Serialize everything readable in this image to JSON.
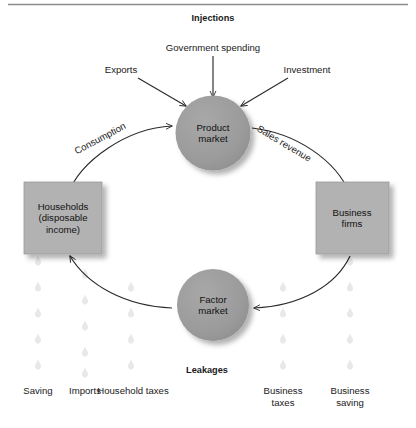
{
  "diagram": {
    "title_top": "Injections",
    "title_bottom": "Leakages",
    "nodes": {
      "product_market": "Product\nmarket",
      "factor_market": "Factor\nmarket",
      "households": "Households\n(disposable\nincome)",
      "business_firms": "Business\nfirms"
    },
    "injection_labels": [
      {
        "id": "exports",
        "text": "Exports"
      },
      {
        "id": "government-spending",
        "text": "Government spending"
      },
      {
        "id": "investment",
        "text": "Investment"
      }
    ],
    "flow_labels": [
      {
        "id": "consumption",
        "text": "Consumption"
      },
      {
        "id": "sales-revenue",
        "text": "Sales revenue"
      }
    ],
    "leakage_labels": [
      {
        "id": "saving",
        "text": "Saving"
      },
      {
        "id": "imports",
        "text": "Imports"
      },
      {
        "id": "household-taxes",
        "text": "Household\ntaxes"
      },
      {
        "id": "business-taxes",
        "text": "Business\ntaxes"
      },
      {
        "id": "business-saving",
        "text": "Business\nsaving"
      }
    ],
    "colors": {
      "circle_fill": "#9b9b9b",
      "box_fill": "#b2b2b2",
      "stroke": "#2b2b2b",
      "droplet": "#e9e9e9",
      "rule": "#8c8c8c",
      "text": "#1a1a1a"
    }
  }
}
